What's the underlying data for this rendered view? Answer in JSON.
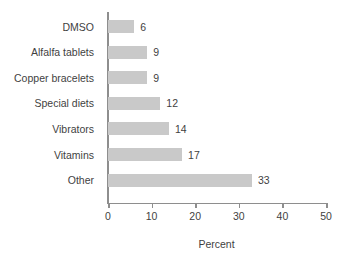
{
  "chart_data": {
    "type": "bar",
    "orientation": "horizontal",
    "title": "",
    "subtitle": "",
    "xlabel": "Percent",
    "ylabel": "",
    "categories": [
      "DMSO",
      "Alfalfa tablets",
      "Copper bracelets",
      "Special diets",
      "Vibrators",
      "Vitamins",
      "Other"
    ],
    "values": [
      6,
      9,
      9,
      12,
      14,
      17,
      33
    ],
    "data_labels": [
      "6",
      "9",
      "9",
      "12",
      "14",
      "17",
      "33"
    ],
    "xlim": [
      0,
      50
    ],
    "xticks": [
      0,
      10,
      20,
      30,
      40,
      50
    ],
    "xtick_labels": [
      "0",
      "10",
      "20",
      "30",
      "40",
      "50"
    ],
    "grid": false,
    "legend": null,
    "legend_position": "none",
    "annotations": [],
    "colors": {
      "bar_fill": "#c9c9c9",
      "axis_line": "#8e8e8e",
      "text": "#3f3f3f",
      "background": "#ffffff"
    }
  }
}
